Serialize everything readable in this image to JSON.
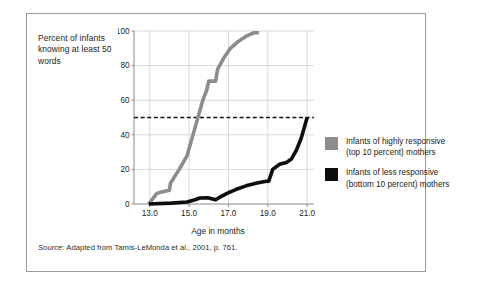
{
  "figure": {
    "y_axis_caption": "Percent of infants knowing at least 50 words",
    "source_lead": "Source:",
    "source_text": " Adapted from Tamis-LeMonda et al., 2001, p. 761."
  },
  "legend": {
    "items": [
      {
        "label": "Infants of highly responsive (top 10 percent) mothers",
        "color": "#8c8c8c",
        "series_key": "highly_responsive"
      },
      {
        "label": "Infants of less responsive (bottom 10 percent) mothers",
        "color": "#0d0d0d",
        "series_key": "less_responsive"
      }
    ]
  },
  "chart_data": {
    "type": "line",
    "title": "",
    "xlabel": "Age in months",
    "ylabel": "Percent of infants knowing at least 50 words",
    "xlim": [
      12.2,
      21.35
    ],
    "ylim": [
      0,
      100
    ],
    "xticks": [
      13.0,
      15.0,
      17.0,
      19.0,
      21.0
    ],
    "xticklabels": [
      "13.0",
      "15.0",
      "17.0",
      "19.0",
      "21.0"
    ],
    "yticks": [
      0,
      20,
      40,
      60,
      80,
      100
    ],
    "yticklabels": [
      "0",
      "20",
      "40",
      "60",
      "80",
      "100"
    ],
    "grid": true,
    "grid_color": "#c8c8c8",
    "axis_color": "#8a8a8a",
    "legend_position": "right-outside",
    "reference_lines": [
      {
        "name": "50-percent-threshold",
        "orientation": "horizontal",
        "value": 50,
        "style": "dashed",
        "color": "#111111"
      }
    ],
    "series": [
      {
        "name": "Infants of highly responsive (top 10 percent) mothers",
        "key": "highly_responsive",
        "color": "#8c8c8c",
        "width": 3.6,
        "x": [
          12.95,
          13.35,
          13.6,
          14.0,
          14.05,
          14.5,
          14.9,
          15.1,
          15.3,
          15.5,
          15.7,
          15.9,
          16.0,
          16.35,
          16.45,
          16.8,
          17.1,
          17.5,
          17.9,
          18.3,
          18.55
        ],
        "y": [
          0,
          6,
          7,
          8,
          12,
          20,
          28,
          36,
          44,
          52,
          60,
          66,
          71,
          71,
          78,
          85,
          90,
          94,
          97,
          99,
          99
        ]
      },
      {
        "name": "Infants of less responsive (bottom 10 percent) mothers",
        "key": "less_responsive",
        "color": "#0d0d0d",
        "width": 3.6,
        "x": [
          12.95,
          14.1,
          14.9,
          15.3,
          15.55,
          15.95,
          16.35,
          16.5,
          16.9,
          17.4,
          17.9,
          18.4,
          18.85,
          19.05,
          19.25,
          19.6,
          19.95,
          20.2,
          20.45,
          20.7,
          20.9,
          21.0
        ],
        "y": [
          0,
          0.5,
          1.2,
          2.5,
          3.5,
          3.6,
          2.4,
          3.5,
          6,
          8.5,
          10.5,
          12,
          13,
          13.2,
          20,
          23,
          24,
          26,
          31,
          38,
          46,
          50
        ]
      }
    ]
  }
}
